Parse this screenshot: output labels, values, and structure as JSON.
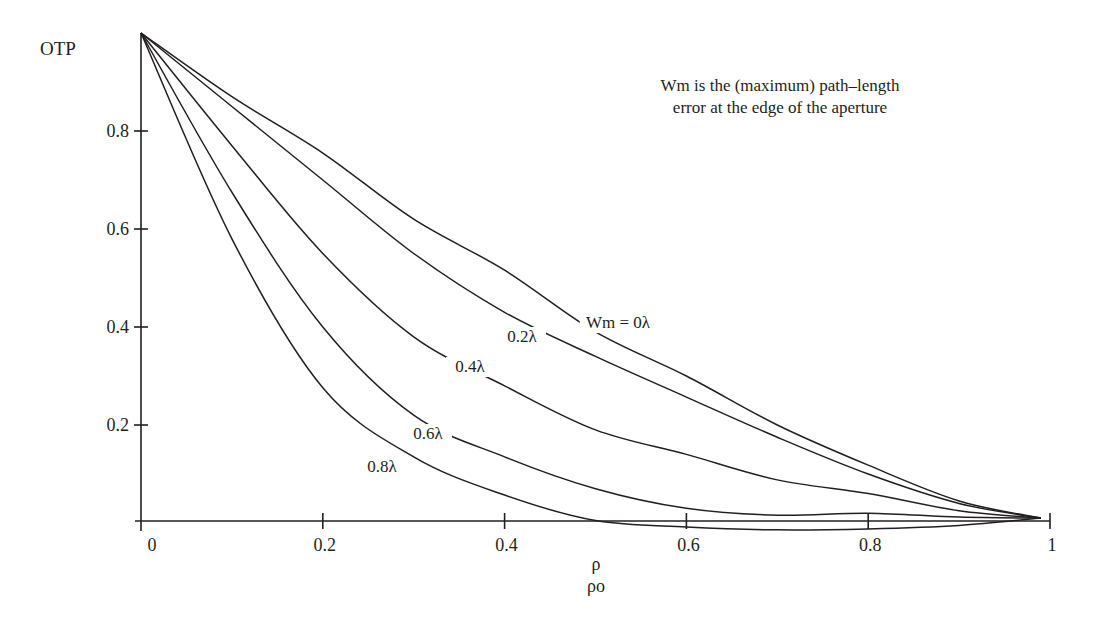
{
  "chart_data": {
    "type": "line",
    "title": "",
    "annotation": [
      "Wm is the (maximum) path–length",
      "error at the edge of the aperture"
    ],
    "xlabel": [
      "ρ",
      "ρo"
    ],
    "ylabel": "OTP",
    "xlim": [
      0,
      1
    ],
    "ylim": [
      0,
      1
    ],
    "x_ticks": [
      0,
      0.2,
      0.4,
      0.6,
      0.8,
      1
    ],
    "x_tick_labels": [
      "0",
      "0.2",
      "0.4",
      "0.6",
      "0.8",
      "1"
    ],
    "y_ticks": [
      0.2,
      0.4,
      0.6,
      0.8
    ],
    "y_tick_labels": [
      "0.2",
      "0.4",
      "0.6",
      "0.8"
    ],
    "grid": false,
    "legend": "inline curve labels",
    "x": [
      0,
      0.1,
      0.2,
      0.3,
      0.4,
      0.5,
      0.6,
      0.7,
      0.8,
      0.9,
      0.99
    ],
    "series": [
      {
        "name": "Wm = 0λ",
        "label": "Wm = 0λ",
        "values": [
          1.0,
          0.87,
          0.755,
          0.62,
          0.516,
          0.39,
          0.3,
          0.2,
          0.118,
          0.045,
          0.01
        ]
      },
      {
        "name": "0.2λ",
        "label": "0.2λ",
        "values": [
          1.0,
          0.85,
          0.7,
          0.55,
          0.43,
          0.34,
          0.257,
          0.175,
          0.1,
          0.04,
          0.01
        ]
      },
      {
        "name": "0.4λ",
        "label": "0.4λ",
        "values": [
          1.0,
          0.77,
          0.55,
          0.38,
          0.28,
          0.19,
          0.14,
          0.088,
          0.06,
          0.025,
          0.01
        ]
      },
      {
        "name": "0.6λ",
        "label": "0.6λ",
        "values": [
          1.0,
          0.675,
          0.4,
          0.22,
          0.135,
          0.07,
          0.03,
          0.016,
          0.02,
          0.012,
          0.01
        ]
      },
      {
        "name": "0.8λ",
        "label": "0.8λ",
        "values": [
          1.0,
          0.58,
          0.276,
          0.135,
          0.057,
          0.005,
          -0.008,
          -0.014,
          -0.012,
          -0.005,
          0.01
        ]
      }
    ],
    "label_positions": [
      {
        "x": 618,
        "y": 328
      },
      {
        "x": 522,
        "y": 342
      },
      {
        "x": 470,
        "y": 372
      },
      {
        "x": 428,
        "y": 439
      },
      {
        "x": 382,
        "y": 472
      }
    ]
  },
  "layout": {
    "x0_px": 141,
    "x1_px": 1050,
    "y0_px": 523,
    "y1_px": 33,
    "ink_color": "#231f20"
  }
}
